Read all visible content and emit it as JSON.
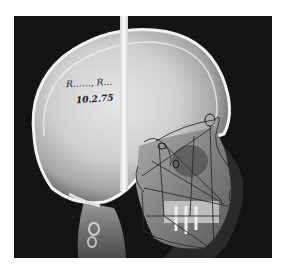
{
  "image": {
    "subject": "Lateral cephalometric skull radiograph with cephalometric tracing overlay",
    "background_color": "#ffffff",
    "film_color": "#141414"
  },
  "annotations": {
    "patient_name": "R……, R…",
    "date": "10.2.75"
  }
}
